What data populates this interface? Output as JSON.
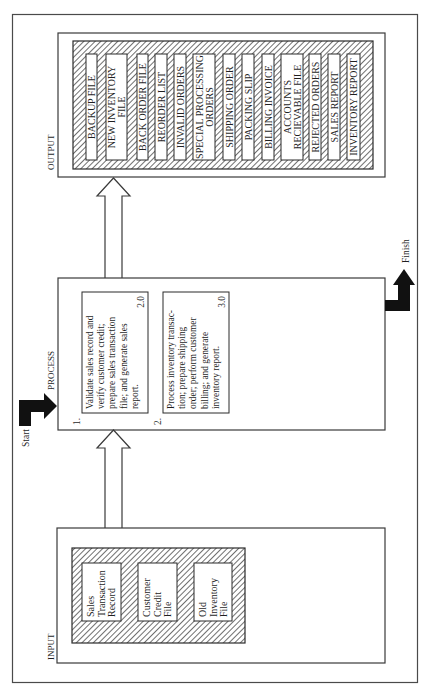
{
  "diagram": {
    "type": "IPO chart (rotated 90°)",
    "orientation": "rotated-counterclockwise",
    "sections": {
      "output": {
        "title": "OUTPUT",
        "items": [
          [
            "BACKUP FILE"
          ],
          [
            "NEW INVENTORY",
            "FILE"
          ],
          [
            "BACK ORDER FILE"
          ],
          [
            "REORDER LIST"
          ],
          [
            "INVALID ORDERS"
          ],
          [
            "SPECIAL PROCESSING",
            "ORDERS"
          ],
          [
            "SHIPPING ORDER"
          ],
          [
            "PACKING SLIP"
          ],
          [
            "BILLING INVOICE"
          ],
          [
            "ACCOUNTS",
            "RECIEVABLE FILE"
          ],
          [
            "REJECTED ORDERS"
          ],
          [
            "SALES REPORT"
          ],
          [
            "INVENTORY REPORT"
          ]
        ]
      },
      "process": {
        "title": "PROCESS",
        "steps": [
          {
            "number": "1.",
            "lines": [
              "Validate sales record and",
              "verify customer credit;",
              "prepare sales transaction",
              "file; and generate sales",
              "report."
            ],
            "ref": "2.0"
          },
          {
            "number": "2.",
            "lines": [
              "Process inventory transac-",
              "tion; prepare shipping",
              "order; perform customer",
              "billing; and generate",
              "inventory report."
            ],
            "ref": "3.0"
          }
        ]
      },
      "input": {
        "title": "INPUT",
        "items": [
          [
            "Sales",
            "Transaction",
            "Record"
          ],
          [
            "Customer",
            "Credit",
            "File"
          ],
          [
            "Old",
            "Inventory",
            "File"
          ]
        ]
      }
    },
    "flow": {
      "start_label": "Start",
      "finish_label": "Finish"
    },
    "colors": {
      "line": "#3a3a3a",
      "solid_arrow": "#111111",
      "background": "#ffffff"
    }
  }
}
